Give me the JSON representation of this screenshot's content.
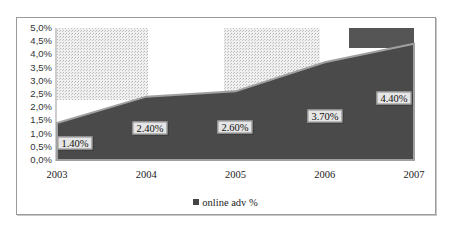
{
  "chart_data": {
    "type": "area",
    "title": "",
    "xlabel": "",
    "ylabel": "",
    "categories": [
      "2003",
      "2004",
      "2005",
      "2006",
      "2007"
    ],
    "series": [
      {
        "name": "online adv %",
        "values": [
          1.4,
          2.4,
          2.6,
          3.7,
          4.4
        ],
        "data_labels": [
          "1.40%",
          "2.40%",
          "2.60%",
          "3.70%",
          "4.40%"
        ]
      }
    ],
    "yticks": [
      "0,0%",
      "0,5%",
      "1,0%",
      "1,5%",
      "2,0%",
      "2,5%",
      "3,0%",
      "3,5%",
      "4,0%",
      "4,5%",
      "5,0%"
    ],
    "ylim": [
      0,
      5
    ],
    "grid": false,
    "legend_position": "bottom"
  },
  "colors": {
    "area": "#4a4a4a",
    "edge": "#9a9a9a",
    "pattern": "#d8d8d8",
    "frame": "#9a9a9a"
  },
  "legend": {
    "label": "online adv %"
  }
}
